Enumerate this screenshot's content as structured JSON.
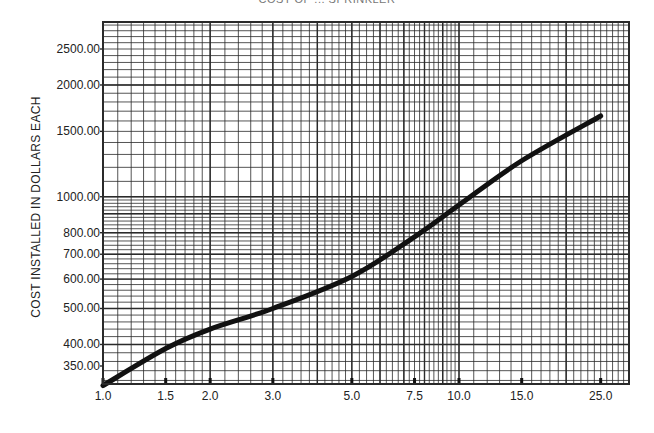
{
  "chart_data": {
    "type": "line",
    "title": "COST OF ... SPRINKLER",
    "xlabel": "",
    "ylabel": "COST INSTALLED IN DOLLARS EACH",
    "x_scale": "log",
    "y_scale": "log",
    "xlim": [
      1.0,
      30.0
    ],
    "ylim": [
      300,
      3000
    ],
    "x_tick_labels": [
      "1.0",
      "1.5",
      "2.0",
      "3.0",
      "5.0",
      "7.5",
      "10.0",
      "15.0",
      "25.0"
    ],
    "x_ticks": [
      1.0,
      1.5,
      2.0,
      3.0,
      5.0,
      7.5,
      10.0,
      15.0,
      25.0
    ],
    "y_tick_labels": [
      "350.00",
      "400.00",
      "500.00",
      "600.00",
      "700.00",
      "800.00",
      "1000.00",
      "1500.00",
      "2000.00",
      "2500.00"
    ],
    "y_ticks": [
      350,
      400,
      500,
      600,
      700,
      800,
      1000,
      1500,
      2000,
      2500
    ],
    "grid": true,
    "legend": null,
    "series": [
      {
        "name": "Cost installed",
        "x": [
          1.0,
          1.5,
          2.0,
          3.0,
          5.0,
          7.5,
          10.0,
          15.0,
          25.0
        ],
        "values": [
          310,
          390,
          440,
          500,
          610,
          780,
          950,
          1250,
          1650
        ]
      }
    ]
  },
  "layout": {
    "plot_left": 103,
    "plot_right": 629,
    "plot_top": 22,
    "plot_bottom": 384,
    "x_ref": [
      [
        1.0,
        103
      ],
      [
        10.0,
        459
      ]
    ],
    "y_ref": [
      [
        2500,
        49
      ],
      [
        350,
        366
      ]
    ]
  },
  "colors": {
    "grid": "#2a2a2a",
    "curve": "#111111",
    "text": "#222222"
  }
}
